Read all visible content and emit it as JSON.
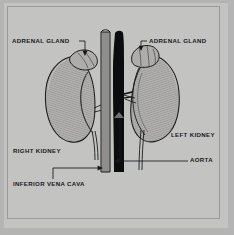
{
  "figure": {
    "background_color": "#c3c3c2",
    "mat_color": "#b4b4b4",
    "frame_line_color": "#9a9a99",
    "ink_color": "#16181a"
  },
  "labels": {
    "adrenal_gland_left": "ADRENAL GLAND",
    "adrenal_gland_right": "ADRENAL GLAND",
    "right_kidney": "RIGHT KIDNEY",
    "left_kidney": "LEFT KIDNEY",
    "aorta": "AORTA",
    "inferior_vena_cava": "INFERIOR VENA CAVA"
  },
  "structures": {
    "aorta_fill": "#0b0c0d",
    "vessel_outline": "#1a1c1e",
    "kidney_fill": "#b0afad",
    "adrenal_fill": "#b5b4b2"
  }
}
